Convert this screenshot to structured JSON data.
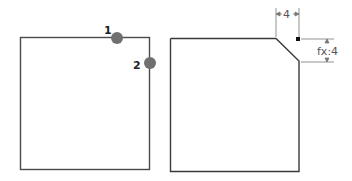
{
  "left_figure": {
    "caption": "square with two selectable corner edges",
    "points": [
      {
        "label": "1",
        "x": 117,
        "y": 38
      },
      {
        "label": "2",
        "x": 150,
        "y": 63
      }
    ],
    "colors": {
      "outline": "#4a4a4a",
      "point": "#707070",
      "label": "#222222"
    }
  },
  "right_figure": {
    "caption": "square with chamfered corner",
    "dimensions": {
      "horizontal": "4",
      "vertical": "fx:4"
    },
    "colors": {
      "outline": "#3a3a3a",
      "dimension": "#666666",
      "marker": "#111111"
    }
  }
}
